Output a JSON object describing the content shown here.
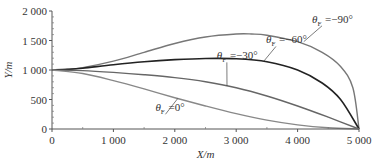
{
  "chart_data": {
    "type": "line",
    "title": "",
    "xlabel": "X/m",
    "ylabel": "Y/m",
    "xlim": [
      0,
      5000
    ],
    "ylim": [
      0,
      2000
    ],
    "xticks": [
      0,
      1000,
      2000,
      3000,
      4000,
      5000
    ],
    "xtick_labels": [
      "0",
      "1 000",
      "2 000",
      "3 000",
      "4 000",
      "5 000"
    ],
    "yticks": [
      0,
      500,
      1000,
      1500,
      2000
    ],
    "ytick_labels": [
      "0",
      "500",
      "1 000",
      "1 500",
      "2 000"
    ],
    "grid": false,
    "legend_position": "inline labels with leader lines",
    "series": [
      {
        "name": "θF = -90°",
        "label_text": "θ",
        "label_sub": "F",
        "label_value": "=−90°",
        "color": "#777777",
        "width": 1.4,
        "x": [
          0,
          250,
          500,
          1000,
          1500,
          2000,
          2500,
          3000,
          3250,
          3500,
          4000,
          4400,
          4700,
          4900,
          5000
        ],
        "y": [
          1000,
          1010,
          1040,
          1150,
          1300,
          1450,
          1560,
          1610,
          1610,
          1590,
          1480,
          1300,
          1060,
          700,
          0
        ]
      },
      {
        "name": "θF = -60°",
        "label_text": "θ",
        "label_sub": "F",
        "label_value": "=−60°",
        "color": "#222222",
        "width": 1.6,
        "x": [
          0,
          250,
          500,
          1000,
          1500,
          2000,
          2500,
          3000,
          3500,
          4000,
          4400,
          4700,
          5000
        ],
        "y": [
          1000,
          1010,
          1030,
          1090,
          1140,
          1175,
          1195,
          1190,
          1140,
          1000,
          780,
          500,
          0
        ]
      },
      {
        "name": "θF = -30°",
        "label_text": "θ",
        "label_sub": "F",
        "label_value": "=−30°",
        "color": "#666666",
        "width": 1.4,
        "x": [
          0,
          500,
          1000,
          1500,
          2000,
          2500,
          3000,
          3500,
          4000,
          4500,
          5000
        ],
        "y": [
          1000,
          990,
          960,
          920,
          870,
          800,
          700,
          560,
          390,
          200,
          0
        ]
      },
      {
        "name": "θF = 0°",
        "label_text": "θ",
        "label_sub": "F",
        "label_value": "=0°",
        "color": "#888888",
        "width": 1.4,
        "x": [
          0,
          500,
          1000,
          1500,
          2000,
          2500,
          3000,
          3500,
          4000,
          4500,
          5000
        ],
        "y": [
          1000,
          940,
          820,
          680,
          530,
          390,
          260,
          150,
          70,
          20,
          0
        ]
      }
    ],
    "annotations": [
      {
        "series": 0,
        "text": "θF =−90°",
        "x": 4300,
        "y": 1800,
        "leader_to": [
          4100,
          1480
        ]
      },
      {
        "series": 1,
        "text": "θF =−60°",
        "x": 3550,
        "y": 1450,
        "leader_to": [
          3450,
          1150
        ]
      },
      {
        "series": 2,
        "text": "θF =−30°",
        "x": 2750,
        "y": 1180,
        "leader_to": [
          2850,
          730
        ]
      },
      {
        "series": 3,
        "text": "θF =0°",
        "x": 1750,
        "y": 300,
        "leader_to": [
          2050,
          520
        ]
      }
    ]
  }
}
